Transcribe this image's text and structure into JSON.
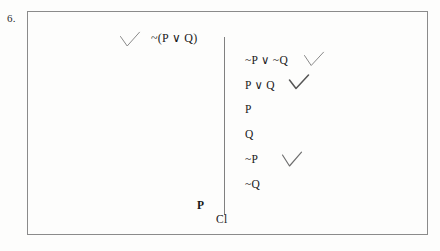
{
  "figure": {
    "problem_number": "6.",
    "type": "semantic-tableau-truth-tree"
  },
  "root": {
    "formula": "~(P ∨ Q)",
    "checked": true,
    "check_glyph": "✓"
  },
  "branch": {
    "lines": [
      {
        "formula": "~P ∨ ~Q",
        "checked": true
      },
      {
        "formula": "P ∨ Q",
        "checked": true
      },
      {
        "formula": "P",
        "checked": false
      },
      {
        "formula": "Q",
        "checked": false
      },
      {
        "formula": "~P",
        "checked": true
      },
      {
        "formula": "~Q",
        "checked": false
      }
    ],
    "closure_label": "Cl"
  },
  "left_branch": {
    "formula": "P"
  },
  "colors": {
    "ink": "#191919",
    "border": "#8b8b8b",
    "branch_line": "#808080",
    "check": "#6e6e6e",
    "paper": "#fdfdfc"
  }
}
